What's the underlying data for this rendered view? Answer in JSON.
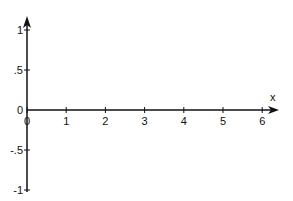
{
  "chart_data": {
    "type": "line",
    "title": "",
    "xlabel": "x",
    "ylabel": "",
    "xlim": [
      0,
      6.4
    ],
    "ylim": [
      -1,
      1.2
    ],
    "x_ticks": [
      0,
      1,
      2,
      3,
      4,
      5,
      6
    ],
    "x_tick_labels": [
      "0",
      "1",
      "2",
      "3",
      "4",
      "5",
      "6"
    ],
    "y_ticks": [
      1,
      0.5,
      0,
      -0.5,
      -1
    ],
    "y_tick_labels": [
      "1",
      ".5",
      "0",
      "-.5",
      "-1"
    ],
    "grid": false,
    "series": [],
    "axis_color": "#111111"
  }
}
